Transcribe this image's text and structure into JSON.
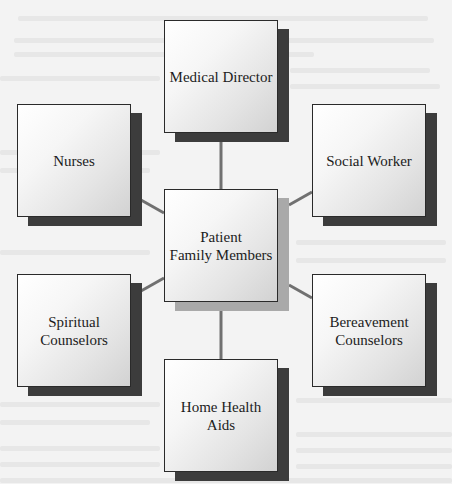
{
  "diagram": {
    "type": "hub-and-spoke",
    "center": {
      "id": "patient-family",
      "label": "Patient\nFamily Members"
    },
    "nodes": [
      {
        "id": "medical-director",
        "label": "Medical Director"
      },
      {
        "id": "nurses",
        "label": "Nurses"
      },
      {
        "id": "social-worker",
        "label": "Social Worker"
      },
      {
        "id": "spiritual-counselors",
        "label": "Spiritual\nCounselors"
      },
      {
        "id": "bereavement-counselors",
        "label": "Bereavement\nCounselors"
      },
      {
        "id": "home-health-aids",
        "label": "Home Health\nAids"
      }
    ],
    "edges": [
      {
        "from": "patient-family",
        "to": "medical-director"
      },
      {
        "from": "patient-family",
        "to": "nurses"
      },
      {
        "from": "patient-family",
        "to": "social-worker"
      },
      {
        "from": "patient-family",
        "to": "spiritual-counselors"
      },
      {
        "from": "patient-family",
        "to": "bereavement-counselors"
      },
      {
        "from": "patient-family",
        "to": "home-health-aids"
      }
    ],
    "colors": {
      "background": "#f3f3f3",
      "box_border": "#2a2a2a",
      "outer_shadow": "#3c3c3c",
      "center_shadow": "#a9a9a9",
      "connector": "#707070",
      "text": "#1c1c1c"
    }
  }
}
